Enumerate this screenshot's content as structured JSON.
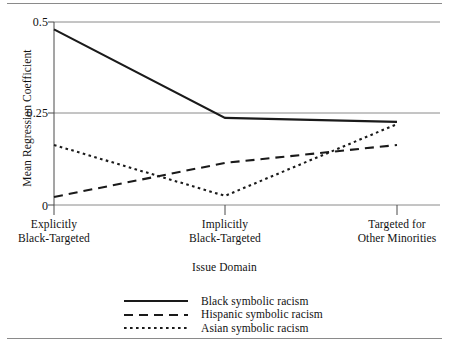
{
  "chart_data": {
    "type": "line",
    "title": "",
    "xlabel": "Issue Domain",
    "ylabel": "Mean Regression Coefficient",
    "categories": [
      "Explicitly\nBlack-Targeted",
      "Implicitly\nBlack-Targeted",
      "Targeted for\nOther Minorities"
    ],
    "category_lines": [
      [
        "Explicitly",
        "Black-Targeted"
      ],
      [
        "Implicitly",
        "Black-Targeted"
      ],
      [
        "Targeted for",
        "Other Minorities"
      ]
    ],
    "ylim": [
      0,
      0.5
    ],
    "yticks": [
      0,
      0.25,
      0.5
    ],
    "ytick_labels": [
      "0",
      "0.25",
      "0.5"
    ],
    "grid": "horizontal",
    "legend_position": "bottom-center",
    "series": [
      {
        "name": "Black symbolic racism",
        "style": "solid",
        "color": "#1a1a1a",
        "values": [
          0.48,
          0.238,
          0.227
        ]
      },
      {
        "name": "Hispanic symbolic racism",
        "style": "dashed",
        "color": "#1a1a1a",
        "values": [
          0.022,
          0.115,
          0.164
        ]
      },
      {
        "name": "Asian symbolic racism",
        "style": "dotted",
        "color": "#1a1a1a",
        "values": [
          0.164,
          0.025,
          0.221
        ]
      }
    ]
  },
  "axes": {
    "ylabel": "Mean Regression Coefficient",
    "xlabel": "Issue Domain",
    "ytick_0": "0",
    "ytick_25": "0.25",
    "ytick_50": "0.5",
    "xtick_1_line1": "Explicitly",
    "xtick_1_line2": "Black-Targeted",
    "xtick_2_line1": "Implicitly",
    "xtick_2_line2": "Black-Targeted",
    "xtick_3_line1": "Targeted for",
    "xtick_3_line2": "Other Minorities"
  },
  "legend": {
    "items": [
      {
        "label": "Black symbolic racism",
        "style": "solid"
      },
      {
        "label": "Hispanic symbolic racism",
        "style": "dashed"
      },
      {
        "label": "Asian symbolic racism",
        "style": "dotted"
      }
    ]
  },
  "colors": {
    "line": "#1a1a1a",
    "grid": "#8a8a8a",
    "rule": "#8a8a8a",
    "text": "#111111",
    "background": "#ffffff"
  }
}
